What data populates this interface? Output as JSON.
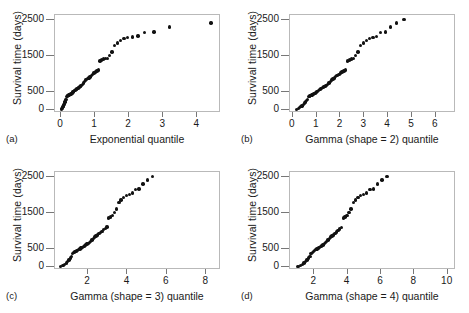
{
  "figure": {
    "ylabel": "Survival time (days)",
    "y_ticks": [
      0,
      500,
      1500,
      2500
    ],
    "ylim": [
      -80,
      2650
    ]
  },
  "chart_data": [
    {
      "type": "scatter",
      "panel": "a",
      "panel_letter": "(a)",
      "title": "",
      "xlabel": "Exponential quantile",
      "ylabel": "Survival time (days)",
      "xticks": [
        0,
        1,
        2,
        3,
        4
      ],
      "yticks": [
        0,
        500,
        1500,
        2500
      ],
      "xlim": [
        -0.18,
        4.7
      ],
      "ylim": [
        -80,
        2650
      ],
      "grid": false,
      "legend": "none",
      "x": [
        0.013,
        0.027,
        0.041,
        0.055,
        0.07,
        0.085,
        0.1,
        0.115,
        0.131,
        0.147,
        0.163,
        0.18,
        0.197,
        0.214,
        0.232,
        0.25,
        0.268,
        0.287,
        0.306,
        0.326,
        0.346,
        0.367,
        0.388,
        0.41,
        0.432,
        0.455,
        0.478,
        0.502,
        0.527,
        0.552,
        0.578,
        0.605,
        0.633,
        0.661,
        0.691,
        0.721,
        0.752,
        0.785,
        0.818,
        0.853,
        0.889,
        0.927,
        0.966,
        1.007,
        1.05,
        1.095,
        1.142,
        1.192,
        1.245,
        1.301,
        1.361,
        1.425,
        1.494,
        1.569,
        1.651,
        1.742,
        1.844,
        1.96,
        2.095,
        2.256,
        2.457,
        2.727,
        3.178,
        4.407
      ],
      "y": [
        20,
        45,
        70,
        95,
        120,
        160,
        200,
        230,
        260,
        300,
        380,
        390,
        400,
        410,
        420,
        430,
        440,
        450,
        460,
        480,
        500,
        520,
        540,
        555,
        570,
        585,
        600,
        615,
        630,
        650,
        670,
        690,
        720,
        760,
        800,
        840,
        860,
        880,
        900,
        920,
        960,
        1000,
        1030,
        1060,
        1090,
        1120,
        1370,
        1400,
        1420,
        1430,
        1440,
        1530,
        1620,
        1800,
        1870,
        1940,
        1990,
        2030,
        2040,
        2060,
        2170,
        2180,
        2320,
        2430,
        2520
      ]
    },
    {
      "type": "scatter",
      "panel": "b",
      "panel_letter": "(b)",
      "title": "",
      "xlabel": "Gamma (shape = 2) quantile",
      "ylabel": "Survival time (days)",
      "xticks": [
        0,
        1,
        2,
        3,
        4,
        5,
        6
      ],
      "yticks": [
        0,
        500,
        1500,
        2500
      ],
      "xlim": [
        -0.12,
        6.85
      ],
      "ylim": [
        -80,
        2650
      ],
      "grid": false,
      "legend": "none",
      "x": [
        0.16,
        0.23,
        0.29,
        0.34,
        0.39,
        0.44,
        0.49,
        0.53,
        0.58,
        0.62,
        0.67,
        0.71,
        0.76,
        0.8,
        0.85,
        0.89,
        0.94,
        0.98,
        1.03,
        1.07,
        1.12,
        1.17,
        1.21,
        1.26,
        1.31,
        1.36,
        1.41,
        1.46,
        1.52,
        1.57,
        1.63,
        1.68,
        1.74,
        1.8,
        1.86,
        1.93,
        2.0,
        2.06,
        2.14,
        2.21,
        2.29,
        2.37,
        2.46,
        2.55,
        2.64,
        2.74,
        2.85,
        2.96,
        3.09,
        3.22,
        3.36,
        3.52,
        3.69,
        3.89,
        4.11,
        4.36,
        4.66,
        5.02,
        5.49,
        6.41
      ],
      "y": [
        20,
        45,
        70,
        95,
        120,
        160,
        200,
        230,
        260,
        300,
        380,
        390,
        400,
        420,
        440,
        460,
        480,
        500,
        520,
        545,
        570,
        590,
        610,
        630,
        650,
        670,
        690,
        720,
        760,
        800,
        840,
        870,
        900,
        930,
        960,
        1000,
        1030,
        1060,
        1090,
        1120,
        1370,
        1400,
        1420,
        1440,
        1530,
        1620,
        1800,
        1870,
        1940,
        1990,
        2030,
        2050,
        2170,
        2180,
        2320,
        2430,
        2520
      ]
    },
    {
      "type": "scatter",
      "panel": "c",
      "panel_letter": "(c)",
      "title": "",
      "xlabel": "Gamma (shape = 3) quantile",
      "ylabel": "Survival time (days)",
      "xticks": [
        2,
        4,
        6,
        8
      ],
      "yticks": [
        0,
        500,
        1500,
        2500
      ],
      "xlim": [
        0.32,
        8.75
      ],
      "ylim": [
        -80,
        2650
      ],
      "grid": false,
      "legend": "none",
      "x": [
        0.6,
        0.72,
        0.81,
        0.89,
        0.96,
        1.03,
        1.1,
        1.16,
        1.22,
        1.28,
        1.34,
        1.4,
        1.46,
        1.52,
        1.58,
        1.64,
        1.7,
        1.76,
        1.82,
        1.88,
        1.94,
        2.0,
        2.07,
        2.13,
        2.2,
        2.27,
        2.34,
        2.41,
        2.48,
        2.55,
        2.63,
        2.71,
        2.79,
        2.87,
        2.96,
        3.05,
        3.14,
        3.24,
        3.34,
        3.45,
        3.56,
        3.68,
        3.81,
        3.94,
        4.09,
        4.24,
        4.41,
        4.59,
        4.79,
        5.01,
        5.26,
        5.54,
        5.87,
        6.26,
        6.74,
        8.18
      ],
      "y": [
        20,
        50,
        80,
        110,
        150,
        200,
        250,
        300,
        380,
        400,
        430,
        450,
        470,
        490,
        510,
        530,
        550,
        570,
        590,
        615,
        640,
        665,
        690,
        720,
        760,
        800,
        840,
        870,
        900,
        930,
        960,
        1000,
        1040,
        1080,
        1120,
        1370,
        1400,
        1430,
        1530,
        1620,
        1800,
        1870,
        1940,
        1990,
        2030,
        2060,
        2170,
        2180,
        2320,
        2430,
        2520
      ]
    },
    {
      "type": "scatter",
      "panel": "d",
      "panel_letter": "(d)",
      "title": "",
      "xlabel": "Gamma (shape = 4) quantile",
      "ylabel": "Survival time (days)",
      "xticks": [
        2,
        4,
        6,
        8,
        10
      ],
      "yticks": [
        0,
        500,
        1500,
        2500
      ],
      "xlim": [
        0.55,
        10.5
      ],
      "ylim": [
        -80,
        2650
      ],
      "grid": false,
      "legend": "none",
      "x": [
        1.02,
        1.18,
        1.3,
        1.4,
        1.49,
        1.58,
        1.66,
        1.74,
        1.81,
        1.89,
        1.96,
        2.03,
        2.1,
        2.17,
        2.24,
        2.31,
        2.38,
        2.45,
        2.52,
        2.6,
        2.67,
        2.75,
        2.83,
        2.91,
        2.99,
        3.07,
        3.16,
        3.25,
        3.34,
        3.43,
        3.53,
        3.63,
        3.74,
        3.85,
        3.96,
        4.08,
        4.21,
        4.34,
        4.48,
        4.63,
        4.79,
        4.96,
        5.14,
        5.34,
        5.56,
        5.8,
        6.07,
        6.37,
        6.72,
        7.13,
        7.63,
        8.27,
        9.73
      ],
      "y": [
        20,
        50,
        80,
        110,
        150,
        200,
        250,
        300,
        380,
        400,
        430,
        460,
        490,
        510,
        530,
        550,
        570,
        590,
        620,
        650,
        680,
        710,
        760,
        800,
        840,
        870,
        900,
        940,
        980,
        1020,
        1060,
        1100,
        1370,
        1400,
        1430,
        1530,
        1620,
        1800,
        1870,
        1940,
        1990,
        2030,
        2060,
        2170,
        2180,
        2320,
        2430,
        2520
      ]
    }
  ]
}
